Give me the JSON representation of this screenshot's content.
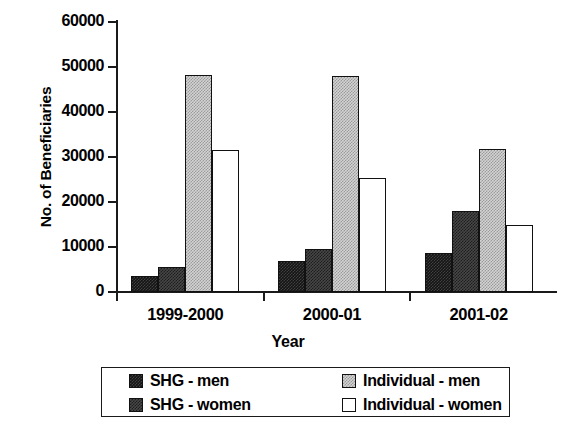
{
  "chart_data": {
    "type": "bar",
    "title": "",
    "xlabel": "Year",
    "ylabel": "No. of Beneficiaries",
    "categories": [
      "1999-2000",
      "2000-01",
      "2001-02"
    ],
    "series": [
      {
        "name": "SHG - men",
        "values": [
          3600,
          7000,
          8700
        ],
        "color": "#141414",
        "pattern": "dense-dark-checker"
      },
      {
        "name": "SHG - women",
        "values": [
          5600,
          9600,
          18000
        ],
        "color": "#474747",
        "pattern": "mid-dark-checker"
      },
      {
        "name": "Individual - men",
        "values": [
          48200,
          48000,
          31700
        ],
        "color": "#d3d3d3",
        "pattern": "light-gray-checker"
      },
      {
        "name": "Individual - women",
        "values": [
          31500,
          25300,
          15000
        ],
        "color": "#ffffff",
        "pattern": "solid-white"
      }
    ],
    "ylim": [
      0,
      60000
    ],
    "yticks": [
      0,
      10000,
      20000,
      30000,
      40000,
      50000,
      60000
    ],
    "ytick_labels": [
      "0",
      "10000",
      "20000",
      "30000",
      "40000",
      "50000",
      "60000"
    ],
    "grid": false,
    "legend_position": "bottom",
    "legend_entries": [
      "SHG - men",
      "SHG - women",
      "Individual - men",
      "Individual - women"
    ]
  }
}
